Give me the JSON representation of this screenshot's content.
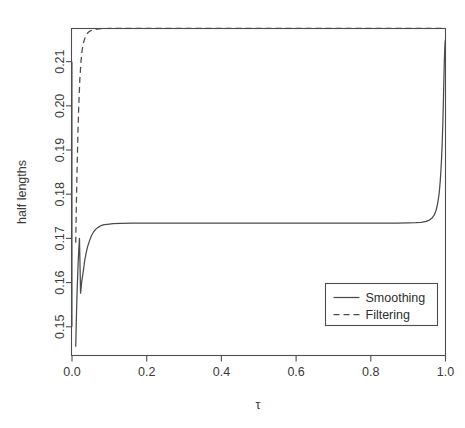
{
  "chart_data": {
    "type": "line",
    "title": "",
    "subtitle": "",
    "xlabel": "τ",
    "ylabel": "half lengths",
    "xlim": [
      0.0,
      1.0
    ],
    "ylim": [
      0.1435,
      0.2175
    ],
    "grid": false,
    "xticks": [
      0.0,
      0.2,
      0.4,
      0.6,
      0.8,
      1.0
    ],
    "xtick_labels": [
      "0.0",
      "0.2",
      "0.4",
      "0.6",
      "0.8",
      "1.0"
    ],
    "yticks": [
      0.15,
      0.16,
      0.17,
      0.18,
      0.19,
      0.2,
      0.21
    ],
    "ytick_labels": [
      "0.15",
      "0.16",
      "0.17",
      "0.18",
      "0.19",
      "0.20",
      "0.21"
    ],
    "legend": {
      "position": "lower-right",
      "entries": [
        {
          "label": "Smoothing",
          "style": "solid"
        },
        {
          "label": "Filtering",
          "style": "dashed"
        }
      ]
    },
    "series": [
      {
        "name": "Smoothing",
        "style": "solid",
        "x": [
          0.01,
          0.012,
          0.014,
          0.016,
          0.018,
          0.02,
          0.023,
          0.026,
          0.03,
          0.034,
          0.038,
          0.042,
          0.047,
          0.052,
          0.058,
          0.064,
          0.07,
          0.078,
          0.086,
          0.095,
          0.11,
          0.13,
          0.16,
          0.2,
          0.25,
          0.3,
          0.35,
          0.4,
          0.45,
          0.5,
          0.55,
          0.6,
          0.65,
          0.7,
          0.75,
          0.8,
          0.84,
          0.87,
          0.9,
          0.92,
          0.935,
          0.948,
          0.957,
          0.964,
          0.97,
          0.975,
          0.979,
          0.983,
          0.986,
          0.989,
          0.991,
          0.993,
          0.995,
          0.9965,
          0.998,
          0.999,
          1.0
        ],
        "y": [
          0.1455,
          0.153,
          0.1588,
          0.1635,
          0.1672,
          0.17,
          0.1576,
          0.1602,
          0.1624,
          0.165,
          0.1668,
          0.1682,
          0.1695,
          0.1706,
          0.1715,
          0.1721,
          0.1725,
          0.1729,
          0.1731,
          0.1732,
          0.17335,
          0.1734,
          0.17343,
          0.17345,
          0.17346,
          0.17346,
          0.17346,
          0.17346,
          0.17346,
          0.17346,
          0.17346,
          0.17346,
          0.17346,
          0.17346,
          0.17346,
          0.17346,
          0.17347,
          0.17348,
          0.1735,
          0.17355,
          0.17365,
          0.17385,
          0.17415,
          0.1746,
          0.1753,
          0.1764,
          0.1779,
          0.1802,
          0.183,
          0.1872,
          0.1912,
          0.1964,
          0.2034,
          0.209,
          0.2129,
          0.2145,
          0.215
        ]
      },
      {
        "name": "Filtering",
        "style": "dashed",
        "x": [
          0.01,
          0.012,
          0.014,
          0.016,
          0.018,
          0.021,
          0.024,
          0.027,
          0.03,
          0.034,
          0.038,
          0.042,
          0.046,
          0.05,
          0.055,
          0.06,
          0.066,
          0.072,
          0.08,
          0.09,
          0.1,
          0.12,
          0.15,
          0.2,
          0.3,
          0.4,
          0.5,
          0.6,
          0.7,
          0.8,
          0.9,
          0.95,
          0.98,
          1.0
        ],
        "y": [
          0.169,
          0.179,
          0.1872,
          0.1942,
          0.1998,
          0.206,
          0.21,
          0.2125,
          0.214,
          0.2152,
          0.216,
          0.2165,
          0.2168,
          0.217,
          0.21715,
          0.21725,
          0.21735,
          0.21742,
          0.21748,
          0.2175,
          0.21752,
          0.21753,
          0.21754,
          0.21754,
          0.21754,
          0.21754,
          0.21754,
          0.21754,
          0.21754,
          0.21754,
          0.21754,
          0.21754,
          0.21754,
          0.21754
        ]
      }
    ]
  }
}
